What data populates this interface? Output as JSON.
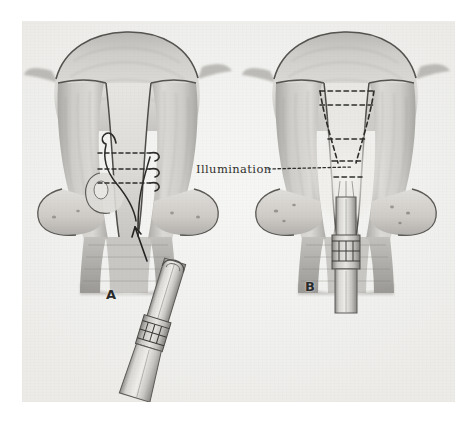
{
  "plate": {
    "kind": "medical-illustration",
    "subject": "Hysteroscopic cervical illumination, two-panel anatomical drawing",
    "background_color": "#ffffff",
    "paper_color": "#f2f1ef",
    "ink_color": "#3a3a38",
    "panels": [
      {
        "id": "A",
        "label": "A",
        "description": "Coronal section of uterus and cervix with illuminating probe approaching the external cervical os from below; curved arrows and dashed lines mark the cervical canal."
      },
      {
        "id": "B",
        "label": "B",
        "description": "Coronal section of uterus and cervix with the probe inserted into the cervical canal; dashed outline delineates the illuminated conical field."
      }
    ],
    "annotations": [
      {
        "id": "illumination",
        "text": "Illumination",
        "leader": "dotted"
      }
    ]
  }
}
